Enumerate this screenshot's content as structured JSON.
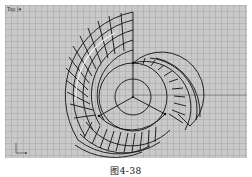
{
  "viewport": {
    "label": "Top |▾",
    "background": "#c9c9c9",
    "grid_color": "#969696",
    "axis_x_label": "x",
    "axis_y_label": "y"
  },
  "model": {
    "description": "Three-blade spiral surface wireframe (top view)",
    "wire_color": "#111111",
    "center": [
      133,
      97
    ],
    "inner_circle_radius": 18,
    "middle_circle_radius": 34,
    "blade_count": 3
  },
  "caption": "图4-38"
}
